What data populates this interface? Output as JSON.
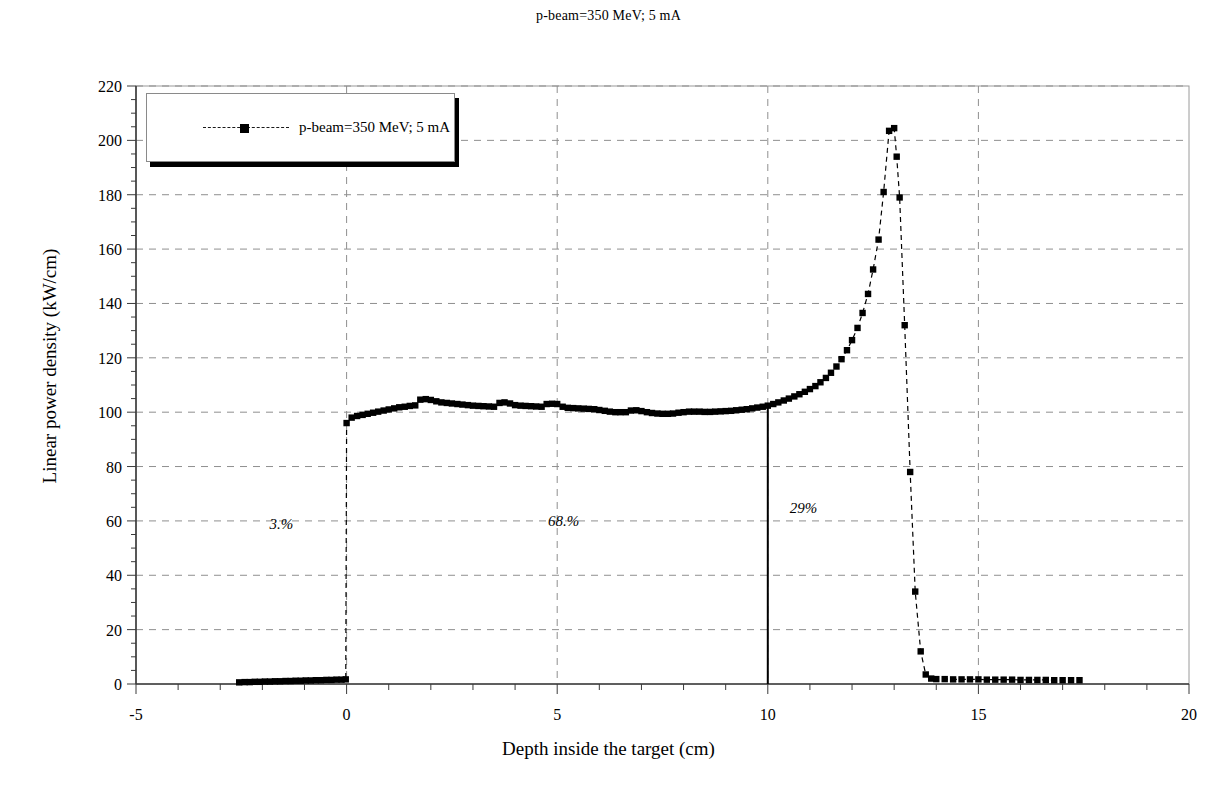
{
  "chart_data": {
    "type": "scatter",
    "title": "p-beam=350 MeV; 5 mA",
    "xlabel": "Depth inside the target (cm)",
    "ylabel": "Linear power density (kW/cm)",
    "xlim": [
      -5,
      20
    ],
    "ylim": [
      0,
      220
    ],
    "xticks": [
      "-5",
      "0",
      "5",
      "10",
      "15",
      "20"
    ],
    "xtick_values": [
      -5,
      0,
      5,
      10,
      15,
      20
    ],
    "yticks": [
      "0",
      "20",
      "40",
      "60",
      "80",
      "100",
      "120",
      "140",
      "160",
      "180",
      "200",
      "220"
    ],
    "ytick_values": [
      0,
      20,
      40,
      60,
      80,
      100,
      120,
      140,
      160,
      180,
      200,
      220
    ],
    "grid": true,
    "grid_style": "dashed",
    "legend_position": "top-left",
    "series": [
      {
        "name": "p-beam=350 MeV; 5 mA",
        "marker": "square",
        "line": "dashed",
        "color": "#000000",
        "points": [
          [
            -2.55,
            0.6
          ],
          [
            -2.42,
            0.7
          ],
          [
            -2.3,
            0.7
          ],
          [
            -2.18,
            0.8
          ],
          [
            -2.06,
            0.8
          ],
          [
            -1.94,
            0.9
          ],
          [
            -1.82,
            0.9
          ],
          [
            -1.7,
            1.0
          ],
          [
            -1.58,
            1.0
          ],
          [
            -1.45,
            1.1
          ],
          [
            -1.33,
            1.1
          ],
          [
            -1.21,
            1.2
          ],
          [
            -1.09,
            1.2
          ],
          [
            -0.97,
            1.3
          ],
          [
            -0.85,
            1.3
          ],
          [
            -0.73,
            1.4
          ],
          [
            -0.61,
            1.4
          ],
          [
            -0.48,
            1.5
          ],
          [
            -0.36,
            1.5
          ],
          [
            -0.24,
            1.6
          ],
          [
            -0.12,
            1.6
          ],
          [
            -0.02,
            1.7
          ],
          [
            0.0,
            96.0
          ],
          [
            0.12,
            98.0
          ],
          [
            0.25,
            98.6
          ],
          [
            0.38,
            99.0
          ],
          [
            0.5,
            99.4
          ],
          [
            0.63,
            99.8
          ],
          [
            0.75,
            100.2
          ],
          [
            0.88,
            100.6
          ],
          [
            1.0,
            101.0
          ],
          [
            1.13,
            101.4
          ],
          [
            1.25,
            101.8
          ],
          [
            1.38,
            102.0
          ],
          [
            1.5,
            102.3
          ],
          [
            1.63,
            102.5
          ],
          [
            1.75,
            104.6
          ],
          [
            1.88,
            104.8
          ],
          [
            2.0,
            104.5
          ],
          [
            2.13,
            104.0
          ],
          [
            2.25,
            103.6
          ],
          [
            2.38,
            103.4
          ],
          [
            2.5,
            103.2
          ],
          [
            2.63,
            103.0
          ],
          [
            2.75,
            102.8
          ],
          [
            2.88,
            102.6
          ],
          [
            3.0,
            102.4
          ],
          [
            3.13,
            102.3
          ],
          [
            3.25,
            102.2
          ],
          [
            3.38,
            102.1
          ],
          [
            3.5,
            102.0
          ],
          [
            3.63,
            103.4
          ],
          [
            3.75,
            103.6
          ],
          [
            3.88,
            103.2
          ],
          [
            4.0,
            102.6
          ],
          [
            4.13,
            102.4
          ],
          [
            4.25,
            102.3
          ],
          [
            4.38,
            102.2
          ],
          [
            4.5,
            102.1
          ],
          [
            4.63,
            102.0
          ],
          [
            4.75,
            103.0
          ],
          [
            4.88,
            103.1
          ],
          [
            5.0,
            103.0
          ],
          [
            5.13,
            102.0
          ],
          [
            5.25,
            101.6
          ],
          [
            5.38,
            101.5
          ],
          [
            5.5,
            101.4
          ],
          [
            5.63,
            101.3
          ],
          [
            5.75,
            101.2
          ],
          [
            5.88,
            101.1
          ],
          [
            6.0,
            100.8
          ],
          [
            6.13,
            100.5
          ],
          [
            6.25,
            100.2
          ],
          [
            6.38,
            100.0
          ],
          [
            6.5,
            100.0
          ],
          [
            6.63,
            100.0
          ],
          [
            6.75,
            100.6
          ],
          [
            6.88,
            100.7
          ],
          [
            7.0,
            100.4
          ],
          [
            7.13,
            100.0
          ],
          [
            7.25,
            99.7
          ],
          [
            7.38,
            99.5
          ],
          [
            7.5,
            99.4
          ],
          [
            7.63,
            99.4
          ],
          [
            7.75,
            99.5
          ],
          [
            7.88,
            99.8
          ],
          [
            8.0,
            100.0
          ],
          [
            8.13,
            100.2
          ],
          [
            8.25,
            100.2
          ],
          [
            8.38,
            100.2
          ],
          [
            8.5,
            100.1
          ],
          [
            8.63,
            100.1
          ],
          [
            8.75,
            100.2
          ],
          [
            8.88,
            100.3
          ],
          [
            9.0,
            100.4
          ],
          [
            9.13,
            100.5
          ],
          [
            9.25,
            100.7
          ],
          [
            9.38,
            100.9
          ],
          [
            9.5,
            101.1
          ],
          [
            9.63,
            101.4
          ],
          [
            9.75,
            101.7
          ],
          [
            9.88,
            102.0
          ],
          [
            10.0,
            102.4
          ],
          [
            10.13,
            103.0
          ],
          [
            10.25,
            103.6
          ],
          [
            10.38,
            104.3
          ],
          [
            10.5,
            105.0
          ],
          [
            10.63,
            105.8
          ],
          [
            10.75,
            106.6
          ],
          [
            10.88,
            107.5
          ],
          [
            11.0,
            108.5
          ],
          [
            11.13,
            109.6
          ],
          [
            11.25,
            111.0
          ],
          [
            11.38,
            112.6
          ],
          [
            11.5,
            114.5
          ],
          [
            11.63,
            116.8
          ],
          [
            11.75,
            119.5
          ],
          [
            11.88,
            122.8
          ],
          [
            12.0,
            126.5
          ],
          [
            12.13,
            131.0
          ],
          [
            12.25,
            136.5
          ],
          [
            12.38,
            143.5
          ],
          [
            12.5,
            152.5
          ],
          [
            12.63,
            163.5
          ],
          [
            12.75,
            181.0
          ],
          [
            12.88,
            203.5
          ],
          [
            13.0,
            204.5
          ],
          [
            13.06,
            194.0
          ],
          [
            13.13,
            179.0
          ],
          [
            13.25,
            132.0
          ],
          [
            13.38,
            78.0
          ],
          [
            13.5,
            34.0
          ],
          [
            13.63,
            12.0
          ],
          [
            13.75,
            3.5
          ],
          [
            13.88,
            2.0
          ],
          [
            14.0,
            1.8
          ],
          [
            14.2,
            1.8
          ],
          [
            14.4,
            1.7
          ],
          [
            14.6,
            1.7
          ],
          [
            14.8,
            1.7
          ],
          [
            15.0,
            1.7
          ],
          [
            15.2,
            1.6
          ],
          [
            15.4,
            1.6
          ],
          [
            15.6,
            1.6
          ],
          [
            15.8,
            1.6
          ],
          [
            16.0,
            1.5
          ],
          [
            16.2,
            1.5
          ],
          [
            16.4,
            1.5
          ],
          [
            16.6,
            1.5
          ],
          [
            16.8,
            1.4
          ],
          [
            17.0,
            1.4
          ],
          [
            17.2,
            1.4
          ],
          [
            17.4,
            1.4
          ]
        ]
      }
    ],
    "annotations": [
      {
        "text": "3.%",
        "x": -1.55,
        "y": 57
      },
      {
        "text": "68.%",
        "x": 5.15,
        "y": 58
      },
      {
        "text": "29%",
        "x": 10.85,
        "y": 63
      }
    ],
    "vertical_marker": {
      "x": 10.0,
      "y_from": 0,
      "y_to": 102.5
    }
  }
}
